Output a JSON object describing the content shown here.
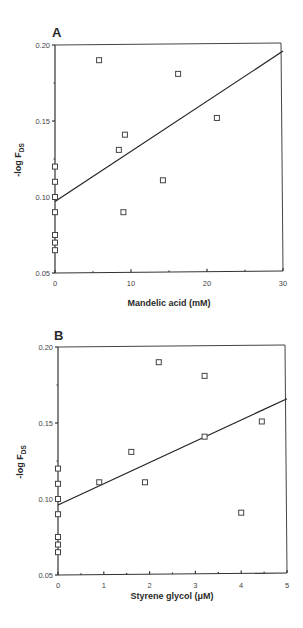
{
  "chart_data": [
    {
      "panel": "A",
      "type": "scatter",
      "title": "",
      "xlabel": "Mandelic acid (mM)",
      "ylabel": "-log F_DS",
      "ylabel_main": "-log F",
      "ylabel_sub": "DS",
      "xlim": [
        0,
        30
      ],
      "ylim": [
        0.05,
        0.2
      ],
      "xticks": [
        0,
        10,
        20,
        30
      ],
      "xtick_labels": [
        "0",
        "10",
        "20",
        "30"
      ],
      "yticks": [
        0.05,
        0.1,
        0.15,
        0.2
      ],
      "ytick_labels": [
        "0.05",
        "0.10",
        "0.15",
        "0.20"
      ],
      "grid": false,
      "points": [
        {
          "x": 0,
          "y": 0.12
        },
        {
          "x": 0,
          "y": 0.11
        },
        {
          "x": 0,
          "y": 0.1
        },
        {
          "x": 0,
          "y": 0.09
        },
        {
          "x": 0,
          "y": 0.075
        },
        {
          "x": 0,
          "y": 0.07
        },
        {
          "x": 0,
          "y": 0.065
        },
        {
          "x": 5.8,
          "y": 0.19
        },
        {
          "x": 16.2,
          "y": 0.181
        },
        {
          "x": 21.3,
          "y": 0.152
        },
        {
          "x": 9.2,
          "y": 0.141
        },
        {
          "x": 8.4,
          "y": 0.131
        },
        {
          "x": 14.2,
          "y": 0.111
        },
        {
          "x": 9.0,
          "y": 0.09
        }
      ],
      "fit_line": {
        "x": [
          0,
          30
        ],
        "y": [
          0.097,
          0.196
        ]
      }
    },
    {
      "panel": "B",
      "type": "scatter",
      "title": "",
      "xlabel": "Styrene glycol (μM)",
      "ylabel": "-log F_DS",
      "ylabel_main": "-log F",
      "ylabel_sub": "DS",
      "xlim": [
        0,
        5
      ],
      "ylim": [
        0.05,
        0.2
      ],
      "xticks": [
        0,
        1,
        2,
        3,
        4,
        5
      ],
      "xtick_labels": [
        "0",
        "1",
        "2",
        "3",
        "4",
        "5"
      ],
      "yticks": [
        0.05,
        0.1,
        0.15,
        0.2
      ],
      "ytick_labels": [
        "0.05",
        "0.10",
        "0.15",
        "0.20"
      ],
      "grid": false,
      "points": [
        {
          "x": 0,
          "y": 0.12
        },
        {
          "x": 0,
          "y": 0.11
        },
        {
          "x": 0,
          "y": 0.1
        },
        {
          "x": 0,
          "y": 0.09
        },
        {
          "x": 0,
          "y": 0.075
        },
        {
          "x": 0,
          "y": 0.07
        },
        {
          "x": 0,
          "y": 0.065
        },
        {
          "x": 2.2,
          "y": 0.19
        },
        {
          "x": 3.2,
          "y": 0.181
        },
        {
          "x": 4.45,
          "y": 0.151
        },
        {
          "x": 3.2,
          "y": 0.141
        },
        {
          "x": 1.6,
          "y": 0.131
        },
        {
          "x": 0.9,
          "y": 0.111
        },
        {
          "x": 1.9,
          "y": 0.111
        },
        {
          "x": 4.0,
          "y": 0.091
        }
      ],
      "fit_line": {
        "x": [
          0,
          5
        ],
        "y": [
          0.096,
          0.166
        ]
      }
    }
  ]
}
